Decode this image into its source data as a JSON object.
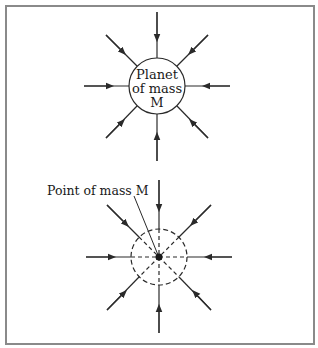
{
  "figure": {
    "top_diagram": {
      "label_lines": [
        "Planet",
        "of mass",
        "M"
      ],
      "circle_style": "solid",
      "center": [
        157,
        86
      ],
      "radius": 28,
      "field_line_count": 8,
      "arrow_direction": "inward"
    },
    "bottom_diagram": {
      "callout_label": "Point of mass M",
      "circle_style": "dashed",
      "center": [
        159,
        257
      ],
      "radius": 28,
      "field_line_count": 8,
      "arrow_direction": "inward"
    },
    "colors": {
      "line": "#2a2a2a",
      "frame": "#8a8a8a",
      "background": "#ffffff"
    }
  }
}
